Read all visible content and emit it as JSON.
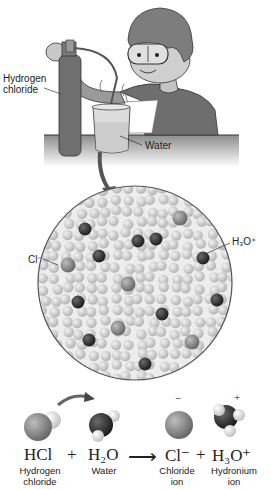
{
  "scene": {
    "labels": {
      "hydrogen_chloride_line1": "Hydrogen",
      "hydrogen_chloride_line2": "chloride",
      "water": "Water"
    }
  },
  "magnified_view": {
    "labels": {
      "chloride": "Cl⁻",
      "hydronium": "H₃O⁺"
    },
    "colors": {
      "water_molecule": "#c8c8c8",
      "chloride_ion": "#8a8a8a",
      "hydronium_ion": "#3a3a3a",
      "circle_border": "#555555"
    }
  },
  "equation": {
    "reactant1": "HCl",
    "plus1": "+",
    "reactant2": "H₂O",
    "arrow": "⟶",
    "product1": "Cl⁻",
    "plus2": "+",
    "product2": "H₃O⁺",
    "charge_minus": "−",
    "charge_plus": "+",
    "captions": {
      "reactant1_line1": "Hydrogen",
      "reactant1_line2": "chloride",
      "reactant2": "Water",
      "product1_line1": "Chloride",
      "product1_line2": "ion",
      "product2_line1": "Hydronium",
      "product2_line2": "ion"
    }
  }
}
